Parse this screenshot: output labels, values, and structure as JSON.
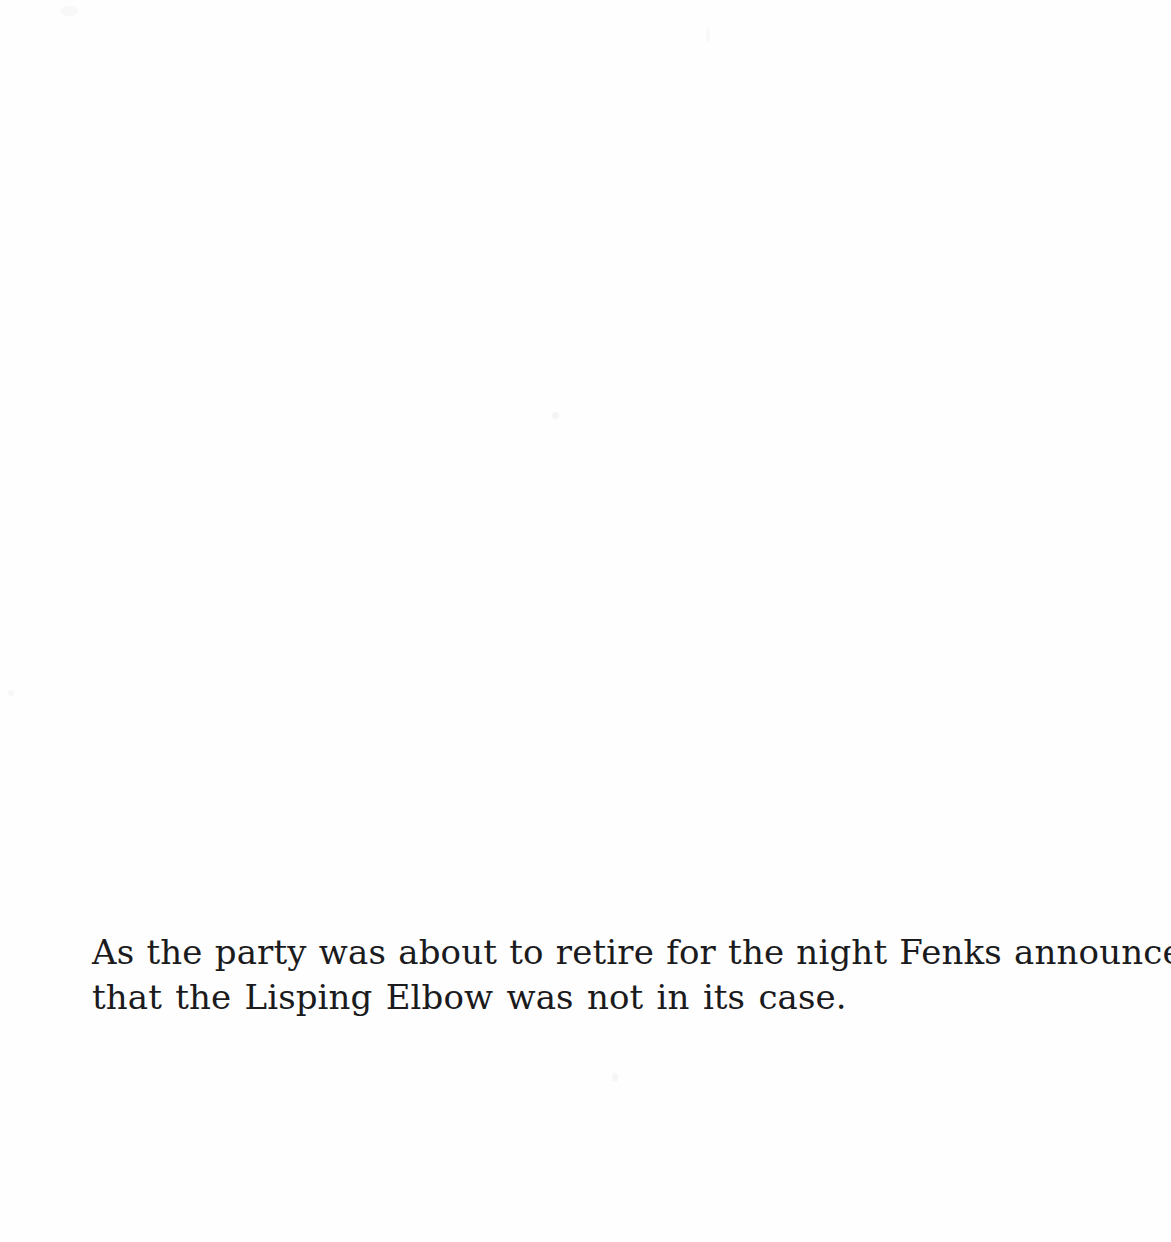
{
  "page": {
    "background_color": "#fefefe",
    "ink_color": "#1b1b1d",
    "width": 1171,
    "height": 1242
  },
  "caption": {
    "full_text": "As the party was about to retire for the night Fenks announced that the Lisping Elbow was not in its case.",
    "lines": [
      "As the party was about to retire for the night Fenks announced",
      "that the Lisping Elbow was not in its case."
    ]
  }
}
